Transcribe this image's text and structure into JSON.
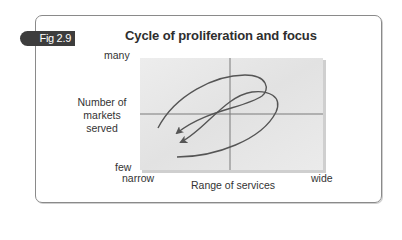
{
  "figure": {
    "badge": "Fig 2.9",
    "title": "Cycle of proliferation and focus",
    "colors": {
      "frame_border": "#8a8a8a",
      "badge_bg": "#3d3d3d",
      "badge_text": "#ffffff",
      "plot_fill": "#e6e6e6",
      "axis_lines": "#7a7a7a",
      "curve": "#555555"
    }
  },
  "axes": {
    "y": {
      "label_lines": [
        "Number of",
        "markets",
        "served"
      ],
      "top_label": "many",
      "bottom_label": "few"
    },
    "x": {
      "label": "Range of services",
      "left_label": "narrow",
      "right_label": "wide"
    }
  },
  "diagram": {
    "quadrants": 4,
    "arrows": [
      {
        "name": "outer-loop",
        "direction": "clockwise spiral ending lower-left"
      },
      {
        "name": "inner-loop",
        "direction": "clockwise spiral ending lower-left"
      }
    ]
  }
}
